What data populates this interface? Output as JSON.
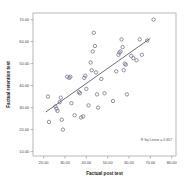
{
  "chart_data": {
    "type": "scatter",
    "title": "",
    "xlabel": "Factual post test",
    "ylabel": "Factual retention test",
    "xlim": [
      15.0,
      82.0
    ],
    "ylim": [
      8.0,
      73.0
    ],
    "xticks": [
      "20.00",
      "30.00",
      "40.00",
      "50.00",
      "60.00",
      "70.00",
      "80.00"
    ],
    "xtick_values": [
      20,
      30,
      40,
      50,
      60,
      70,
      80
    ],
    "yticks": [
      "10.00",
      "20.00",
      "30.00",
      "40.00",
      "50.00",
      "60.00",
      "70.00"
    ],
    "ytick_values": [
      10,
      20,
      30,
      40,
      50,
      60,
      70
    ],
    "grid": false,
    "legend": "none",
    "marker": "open-circle",
    "annotation": "R Sq Linear = 0.657",
    "fit_line": {
      "type": "linear",
      "x_start": 21.0,
      "y_start": 28.0,
      "x_end": 70.0,
      "y_end": 61.5
    },
    "points": [
      {
        "x": 22.0,
        "y": 35.0
      },
      {
        "x": 22.5,
        "y": 23.5
      },
      {
        "x": 25.5,
        "y": 30.5
      },
      {
        "x": 26.0,
        "y": 29.5
      },
      {
        "x": 26.5,
        "y": 28.5
      },
      {
        "x": 27.5,
        "y": 32.5
      },
      {
        "x": 28.0,
        "y": 34.5
      },
      {
        "x": 28.5,
        "y": 24.5
      },
      {
        "x": 29.0,
        "y": 20.0
      },
      {
        "x": 31.0,
        "y": 44.0
      },
      {
        "x": 32.0,
        "y": 43.5
      },
      {
        "x": 32.5,
        "y": 44.0
      },
      {
        "x": 33.0,
        "y": 32.0
      },
      {
        "x": 34.5,
        "y": 26.5
      },
      {
        "x": 36.5,
        "y": 37.0
      },
      {
        "x": 37.0,
        "y": 36.5
      },
      {
        "x": 37.5,
        "y": 25.5
      },
      {
        "x": 38.5,
        "y": 26.0
      },
      {
        "x": 39.0,
        "y": 43.5
      },
      {
        "x": 39.5,
        "y": 44.5
      },
      {
        "x": 40.0,
        "y": 38.5
      },
      {
        "x": 41.0,
        "y": 31.0
      },
      {
        "x": 42.0,
        "y": 50.5
      },
      {
        "x": 42.5,
        "y": 47.0
      },
      {
        "x": 43.0,
        "y": 55.5
      },
      {
        "x": 43.5,
        "y": 64.0
      },
      {
        "x": 44.0,
        "y": 58.0
      },
      {
        "x": 44.5,
        "y": 46.0
      },
      {
        "x": 45.0,
        "y": 36.0
      },
      {
        "x": 45.5,
        "y": 30.0
      },
      {
        "x": 47.0,
        "y": 43.0
      },
      {
        "x": 48.5,
        "y": 36.5
      },
      {
        "x": 52.5,
        "y": 33.0
      },
      {
        "x": 54.0,
        "y": 46.5
      },
      {
        "x": 55.0,
        "y": 54.0
      },
      {
        "x": 55.5,
        "y": 55.0
      },
      {
        "x": 56.0,
        "y": 55.5
      },
      {
        "x": 56.5,
        "y": 61.0
      },
      {
        "x": 57.0,
        "y": 57.5
      },
      {
        "x": 57.5,
        "y": 47.0
      },
      {
        "x": 58.0,
        "y": 50.0
      },
      {
        "x": 58.5,
        "y": 49.5
      },
      {
        "x": 59.0,
        "y": 36.0
      },
      {
        "x": 61.0,
        "y": 53.5
      },
      {
        "x": 62.0,
        "y": 52.5
      },
      {
        "x": 63.5,
        "y": 51.5
      },
      {
        "x": 65.0,
        "y": 61.0
      },
      {
        "x": 66.0,
        "y": 54.0
      },
      {
        "x": 68.5,
        "y": 60.5
      },
      {
        "x": 71.5,
        "y": 70.0
      }
    ]
  },
  "annotation_label": "R Sq Linear = 0.657"
}
